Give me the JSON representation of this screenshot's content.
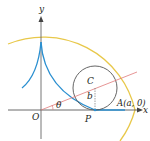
{
  "diagram": {
    "labels": {
      "y_axis": "y",
      "x_axis": "x",
      "origin": "O",
      "center": "C",
      "radius": "b",
      "angle": "θ",
      "point_p": "P",
      "point_a": "A(a, 0)"
    },
    "colors": {
      "large_circle": "#e8c84a",
      "curve": "#2a8fd0",
      "small_circle": "#555555",
      "radius_line": "#e07a7a",
      "axes": "#333333"
    }
  }
}
